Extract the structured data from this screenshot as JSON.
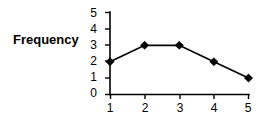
{
  "chart_data": {
    "type": "line",
    "title": "",
    "xlabel": "",
    "ylabel": "Frequency",
    "categories": [
      "1",
      "2",
      "3",
      "4",
      "5"
    ],
    "x": [
      1,
      2,
      3,
      4,
      5
    ],
    "values": [
      2,
      3,
      3,
      2,
      1
    ],
    "series": [
      {
        "name": "Frequency",
        "values": [
          2,
          3,
          3,
          2,
          1
        ]
      }
    ],
    "xlim": [
      1,
      5
    ],
    "ylim": [
      0,
      5
    ],
    "y_ticks": [
      "0",
      "1",
      "2",
      "3",
      "4",
      "5"
    ],
    "x_ticks": [
      "1",
      "2",
      "3",
      "4",
      "5"
    ],
    "grid": false,
    "legend": false,
    "marker": "diamond",
    "line_color": "#000000",
    "marker_color": "#000000",
    "background_color": "#ffffff"
  },
  "labels": {
    "y_axis_title": "Frequency"
  }
}
